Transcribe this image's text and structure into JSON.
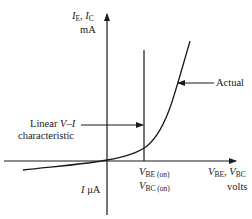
{
  "diagram": {
    "type": "bjt-diode-iv-characteristic",
    "y_axis": {
      "label_line1_var1": "I",
      "label_line1_sub1": "E",
      "label_line1_sep": ", ",
      "label_line1_var2": "I",
      "label_line1_sub2": "C",
      "label_line2": "mA"
    },
    "x_axis": {
      "label_line1_var1": "V",
      "label_line1_sub1": "BE",
      "label_line1_sep": ", ",
      "label_line1_var2": "V",
      "label_line1_sub2": "BC",
      "label_line2": "volts"
    },
    "negative_y_label": {
      "var": "I",
      "unit": " μA"
    },
    "threshold": {
      "line1_var": "V",
      "line1_sub": "BE (on)",
      "line2_var": "V",
      "line2_sub": "BC (on)"
    },
    "annotations": {
      "actual": "Actual",
      "linear_line1_text": "Linear  ",
      "linear_line1_var": "V–I",
      "linear_line2": "characteristic"
    },
    "colors": {
      "ink": "#1a1a1a",
      "background": "#ffffff"
    }
  }
}
